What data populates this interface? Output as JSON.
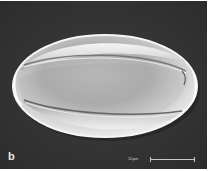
{
  "figure": {
    "panel_label": "b",
    "scale_bar": {
      "label": "10μm"
    },
    "colors": {
      "background": "#333333",
      "grain_highlight": "#f0f0f0",
      "grain_mid": "#c4c4c4",
      "grain_shadow": "#8a8a8a",
      "border": "#ffffff",
      "scale_bar": "#c8c8c8"
    }
  }
}
